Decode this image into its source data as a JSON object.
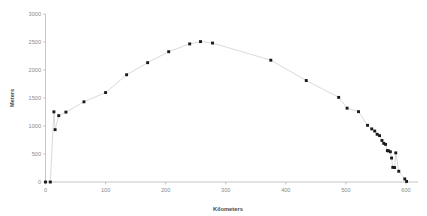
{
  "chart_data": {
    "type": "line",
    "title": "",
    "subtitle": "",
    "xlabel": "Kilometers",
    "ylabel": "Meters",
    "xlim": [
      0,
      620
    ],
    "ylim": [
      0,
      3000
    ],
    "xticks": [
      0,
      100,
      200,
      300,
      400,
      500,
      600
    ],
    "yticks": [
      0,
      500,
      1000,
      1500,
      2000,
      2500,
      3000
    ],
    "xtick_labels": [
      "0",
      "100",
      "200",
      "300",
      "400",
      "500",
      "600"
    ],
    "ytick_labels": [
      "0",
      "500",
      "1000",
      "1500",
      "2000",
      "2500",
      "3000"
    ],
    "grid": false,
    "legend": null,
    "marker": "square",
    "marker_color": "#1a1a1a",
    "line_color": "#d6d6d6",
    "series": [
      {
        "name": "Elevation profile",
        "x": [
          0,
          8,
          14,
          16,
          22,
          34,
          64,
          100,
          135,
          170,
          205,
          240,
          258,
          278,
          375,
          434,
          488,
          502,
          521,
          536,
          543,
          548,
          552,
          556,
          560,
          563,
          566,
          569,
          571,
          574,
          576,
          578,
          581,
          583,
          588,
          598,
          601
        ],
        "y": [
          0,
          0,
          1253,
          935,
          1185,
          1248,
          1432,
          1597,
          1915,
          2131,
          2327,
          2466,
          2507,
          2481,
          2175,
          1812,
          1511,
          1318,
          1256,
          1012,
          948,
          910,
          852,
          828,
          742,
          690,
          672,
          560,
          556,
          540,
          428,
          262,
          258,
          520,
          192,
          55,
          10
        ]
      }
    ]
  }
}
